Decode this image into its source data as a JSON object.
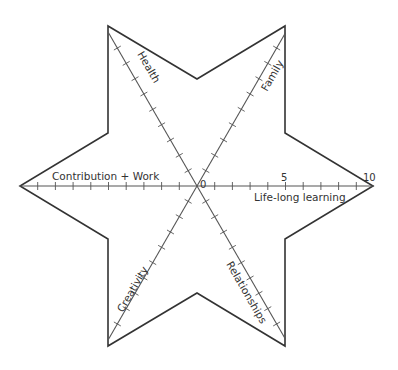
{
  "diagram": {
    "type": "six-point-star-wheel",
    "center": [
      197,
      186
    ],
    "radius": 177,
    "scale": {
      "min": 0,
      "max": 10,
      "ticks": 10,
      "labels": [
        "0",
        "5",
        "10"
      ]
    },
    "colors": {
      "outline": "#333333",
      "axis": "#555555",
      "text": "#333333",
      "background": "#ffffff"
    },
    "outer_vertices": [
      [
        285,
        26
      ],
      [
        373,
        186
      ],
      [
        285,
        346
      ],
      [
        108,
        346
      ],
      [
        20,
        186
      ],
      [
        108,
        26
      ]
    ],
    "inner_vertices": [
      [
        285,
        133
      ],
      [
        285,
        239
      ],
      [
        197,
        293
      ],
      [
        108,
        239
      ],
      [
        108,
        133
      ],
      [
        197,
        79
      ]
    ],
    "axes": [
      {
        "id": "life-long-learning",
        "label": "Life-long learning",
        "angle": 0
      },
      {
        "id": "family",
        "label": "Family",
        "angle": -60
      },
      {
        "id": "health",
        "label": "Health",
        "angle": -120
      },
      {
        "id": "contribution-work",
        "label": "Contribution + Work",
        "angle": 180
      },
      {
        "id": "creativity",
        "label": "Creativity",
        "angle": 120
      },
      {
        "id": "relationships",
        "label": "Relationships",
        "angle": 60
      }
    ]
  },
  "labels": {
    "life_long_learning": "Life-long learning",
    "family": "Family",
    "health": "Health",
    "contribution_work": "Contribution + Work",
    "creativity": "Creativity",
    "relationships": "Relationships",
    "scale_0": "0",
    "scale_5": "5",
    "scale_10": "10"
  }
}
